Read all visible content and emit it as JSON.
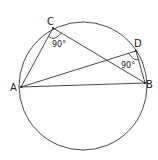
{
  "diagram": {
    "type": "circle-geometry",
    "circle": {
      "cx": 83,
      "cy": 86,
      "r": 64
    },
    "points": {
      "A": {
        "label": "A",
        "x": 21,
        "y": 87
      },
      "B": {
        "label": "B",
        "x": 145,
        "y": 83
      },
      "C": {
        "label": "C",
        "x": 53,
        "y": 28
      },
      "D": {
        "label": "D",
        "x": 136,
        "y": 51
      }
    },
    "segments": [
      "AC",
      "CB",
      "AD",
      "DB",
      "AB"
    ],
    "angles": {
      "C": {
        "label": "90°"
      },
      "D": {
        "label": "90°"
      }
    }
  }
}
